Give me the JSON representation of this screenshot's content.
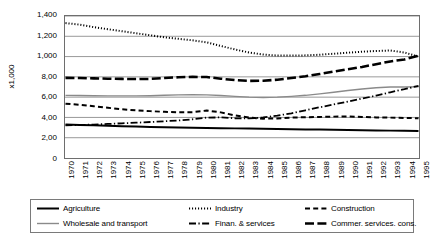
{
  "chart_data": {
    "type": "line",
    "title": "",
    "xlabel": "",
    "ylabel": "x1,000",
    "ylim": [
      0,
      1400
    ],
    "ytick_labels": [
      "1,400",
      "1,200",
      "1,000",
      "8,00",
      "6,00",
      "4,00",
      "2,00",
      "0"
    ],
    "ytick_values": [
      1400,
      1200,
      1000,
      800,
      600,
      400,
      200,
      0
    ],
    "grid": true,
    "legend_position": "bottom",
    "x": [
      1970,
      1971,
      1972,
      1973,
      1974,
      1975,
      1976,
      1977,
      1978,
      1979,
      1980,
      1981,
      1982,
      1983,
      1984,
      1985,
      1986,
      1987,
      1988,
      1989,
      1990,
      1991,
      1992,
      1993,
      1994,
      1995
    ],
    "xtick_labels": [
      "1970",
      "1971",
      "1972",
      "1973",
      "1974",
      "1975",
      "1976",
      "1977",
      "1978",
      "1979",
      "1980",
      "1981",
      "1982",
      "1983",
      "1984",
      "1985",
      "1986",
      "1987",
      "1988",
      "1989",
      "1990",
      "1991",
      "1992",
      "1993",
      "1994",
      "1995"
    ],
    "series": [
      {
        "name": "Agriculture",
        "style": "solid",
        "color": "#000000",
        "width": 2.0,
        "values": [
          330,
          326,
          322,
          318,
          314,
          310,
          306,
          303,
          300,
          298,
          296,
          294,
          292,
          290,
          288,
          286,
          284,
          282,
          280,
          278,
          276,
          274,
          272,
          270,
          268,
          266
        ]
      },
      {
        "name": "Industry",
        "style": "dotted",
        "color": "#000000",
        "width": 2.0,
        "values": [
          1330,
          1315,
          1290,
          1270,
          1250,
          1230,
          1210,
          1190,
          1175,
          1160,
          1140,
          1105,
          1070,
          1040,
          1020,
          1010,
          1010,
          1012,
          1018,
          1028,
          1038,
          1048,
          1055,
          1060,
          1040,
          1000
        ]
      },
      {
        "name": "Construction",
        "style": "dashed",
        "color": "#000000",
        "width": 2.0,
        "values": [
          535,
          525,
          510,
          495,
          480,
          470,
          462,
          455,
          450,
          452,
          468,
          450,
          420,
          398,
          388,
          390,
          398,
          402,
          405,
          408,
          410,
          405,
          400,
          398,
          395,
          392
        ]
      },
      {
        "name": "Wholesale and transport",
        "style": "solid",
        "color": "#8a8a8a",
        "width": 1.4,
        "values": [
          617,
          616,
          614,
          613,
          612,
          612,
          614,
          618,
          622,
          624,
          622,
          616,
          608,
          600,
          596,
          600,
          608,
          618,
          632,
          648,
          665,
          680,
          692,
          700,
          700,
          702
        ]
      },
      {
        "name": "Finan. & services",
        "style": "dashdot",
        "color": "#000000",
        "width": 1.8,
        "values": [
          322,
          325,
          330,
          336,
          342,
          348,
          355,
          362,
          370,
          382,
          398,
          400,
          392,
          390,
          400,
          418,
          440,
          470,
          500,
          528,
          556,
          585,
          615,
          648,
          678,
          712
        ]
      },
      {
        "name": "Commer. services. cons.",
        "style": "longdash",
        "color": "#000000",
        "width": 2.6,
        "values": [
          790,
          788,
          785,
          782,
          780,
          778,
          780,
          788,
          796,
          800,
          798,
          782,
          768,
          760,
          762,
          772,
          788,
          806,
          828,
          852,
          875,
          898,
          925,
          952,
          972,
          1010
        ]
      }
    ]
  },
  "legend": {
    "items": [
      {
        "label": "Agriculture",
        "swatch": "solid-black-line-swatch"
      },
      {
        "label": "Industry",
        "swatch": "dotted-line-swatch"
      },
      {
        "label": "Construction",
        "swatch": "dashed-line-swatch"
      },
      {
        "label": "Wholesale and transport",
        "swatch": "solid-gray-line-swatch"
      },
      {
        "label": "Finan. & services",
        "swatch": "dashdot-line-swatch"
      },
      {
        "label": "Commer. services. cons.",
        "swatch": "longdash-line-swatch"
      }
    ]
  }
}
